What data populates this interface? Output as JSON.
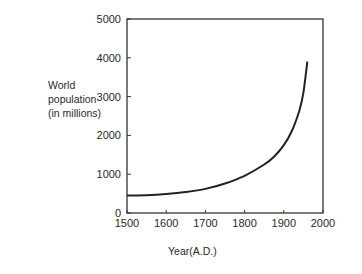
{
  "chart_data": {
    "type": "line",
    "title": "",
    "xlabel": "Year(A.D.)",
    "ylabel": [
      "World",
      "population",
      "(in millions)"
    ],
    "xlim": [
      1500,
      2000
    ],
    "ylim": [
      0,
      5000
    ],
    "x_ticks": [
      "1500",
      "1600",
      "1700",
      "1800",
      "1900",
      "2000"
    ],
    "y_ticks": [
      "0",
      "1000",
      "2000",
      "3000",
      "4000",
      "5000"
    ],
    "grid": false,
    "legend": null,
    "series": [
      {
        "name": "World population",
        "x": [
          1500,
          1550,
          1600,
          1650,
          1700,
          1750,
          1800,
          1850,
          1875,
          1900,
          1920,
          1940,
          1950,
          1960
        ],
        "y": [
          450,
          460,
          490,
          540,
          620,
          760,
          960,
          1250,
          1450,
          1750,
          2100,
          2650,
          3100,
          3900
        ]
      }
    ]
  }
}
